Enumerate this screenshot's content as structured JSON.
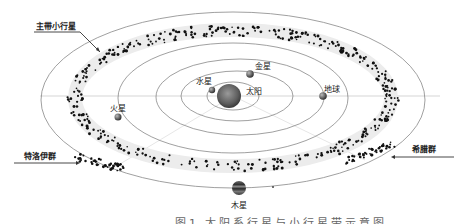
{
  "diagram": {
    "caption": "图1  太阳系行星与小行星带示意图",
    "center_body": {
      "name": "太阳",
      "x": 233,
      "y": 96,
      "r": 12
    },
    "planets": [
      {
        "id": "mercury",
        "name": "水星",
        "orbit_rx": 30,
        "orbit_ry": 15,
        "x": 214,
        "y": 90,
        "label_dx": -18,
        "label_dy": -14
      },
      {
        "id": "venus",
        "name": "金星",
        "orbit_rx": 52,
        "orbit_ry": 25,
        "x": 250,
        "y": 73,
        "label_dx": 5,
        "label_dy": -15
      },
      {
        "id": "earth",
        "name": "地球",
        "orbit_rx": 78,
        "orbit_ry": 38,
        "x": 322,
        "y": 96,
        "label_dx": 2,
        "label_dy": -13
      },
      {
        "id": "mars",
        "name": "火星",
        "orbit_rx": 115,
        "orbit_ry": 55,
        "x": 118,
        "y": 117,
        "label_dx": -8,
        "label_dy": -15
      },
      {
        "id": "jupiter",
        "name": "木星",
        "orbit_rx": 192,
        "orbit_ry": 88,
        "x": 239,
        "y": 188,
        "label_dx": -8,
        "label_dy": 12
      }
    ],
    "callouts": [
      {
        "id": "main-belt",
        "text": "主带小行星",
        "label_x": 36,
        "label_y": 24
      },
      {
        "id": "trojans",
        "text": "特洛伊群",
        "label_x": 24,
        "label_y": 153
      },
      {
        "id": "greeks",
        "text": "希腊群",
        "label_x": 412,
        "label_y": 144
      }
    ],
    "colors": {
      "orbit": "#777777",
      "belt_band": "#e9e9e9",
      "asteroid": "#111111",
      "sun": "#6e6e6e",
      "planet": "#555555"
    }
  }
}
